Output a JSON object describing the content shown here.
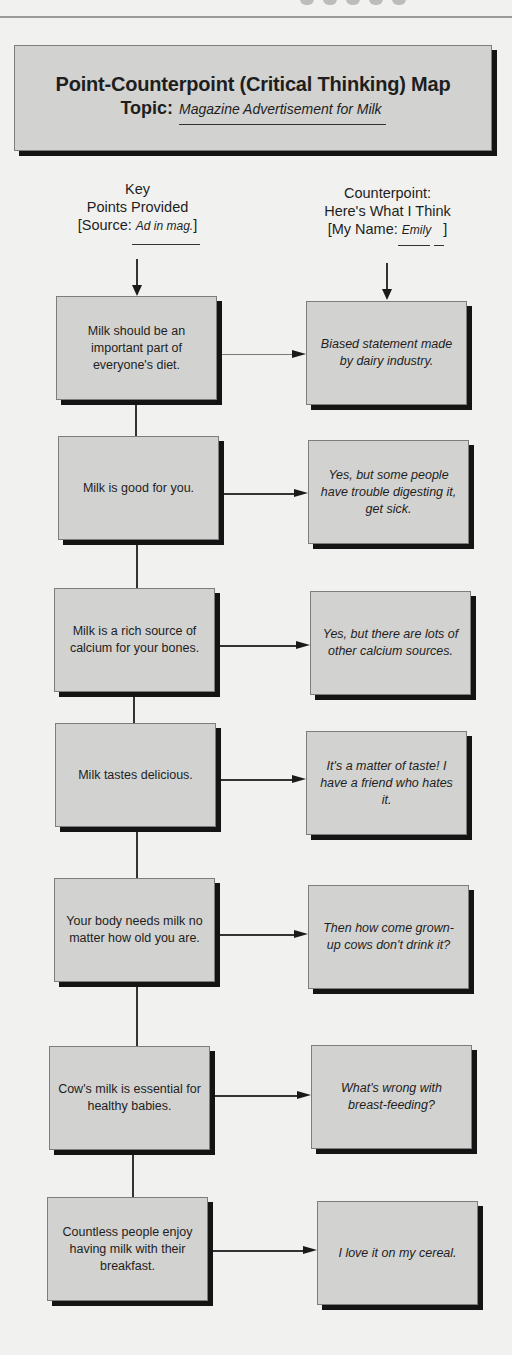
{
  "header": {
    "title": "Point-Counterpoint (Critical Thinking) Map",
    "topic_label": "Topic:",
    "topic_value": "Magazine Advertisement for Milk"
  },
  "columns": {
    "left": {
      "line1": "Key",
      "line2": "Points Provided",
      "source_prefix": "[Source: ",
      "source_value": "Ad in mag.",
      "source_suffix": "]"
    },
    "right": {
      "line1": "Counterpoint:",
      "line2": "Here's What I Think",
      "name_prefix": "[My Name: ",
      "name_value": "Emily",
      "name_suffix": "]"
    }
  },
  "pairs": [
    {
      "point": "Milk should be an important part of everyone's diet.",
      "counterpoint": "Biased statement made by dairy industry."
    },
    {
      "point": "Milk is good for you.",
      "counterpoint": "Yes, but some people have trouble digesting it, get sick."
    },
    {
      "point": "Milk is a rich source of calcium for your bones.",
      "counterpoint": "Yes, but there are lots of other calcium sources."
    },
    {
      "point": "Milk tastes delicious.",
      "counterpoint": "It's a matter of taste! I have a friend who hates it."
    },
    {
      "point": "Your body needs milk no matter how old you are.",
      "counterpoint": "Then how come grown-up cows don't drink it?"
    },
    {
      "point": "Cow's milk is essential for healthy babies.",
      "counterpoint": "What's wrong with breast-feeding?"
    },
    {
      "point": "Countless people enjoy having milk with their breakfast.",
      "counterpoint": "I love it on my cereal."
    }
  ],
  "colors": {
    "box_fill": "#d2d2d0",
    "box_shadow": "#141414",
    "page_bg": "#f1f1ef",
    "line": "#333333"
  }
}
